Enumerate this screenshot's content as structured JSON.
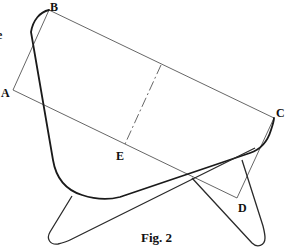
{
  "figure": {
    "caption": "Fig. 2",
    "edge_fragment": "e",
    "points": [
      {
        "label": "A",
        "x": 13,
        "y": 90
      },
      {
        "label": "B",
        "x": 49,
        "y": 10
      },
      {
        "label": "C",
        "x": 274,
        "y": 118
      },
      {
        "label": "D",
        "x": 237,
        "y": 198
      },
      {
        "label": "E",
        "x": 125,
        "y": 144
      }
    ],
    "labels": {
      "A": "A",
      "B": "B",
      "C": "C",
      "D": "D",
      "E": "E"
    },
    "colors": {
      "outline": "#1a1a1a",
      "frame": "#555555",
      "background": "#ffffff"
    }
  }
}
